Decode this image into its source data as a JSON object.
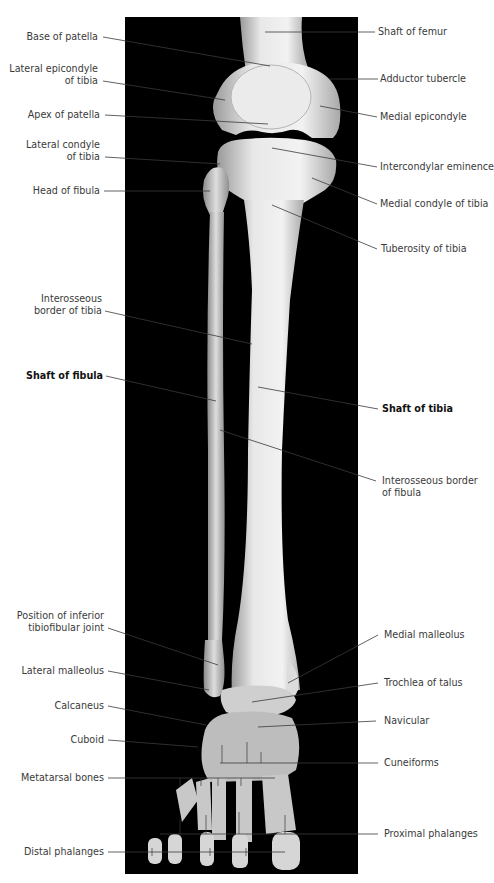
{
  "figure": {
    "panel_color": "#000000",
    "bone_color": "#e4e4e4",
    "leader_color": "#3a3a3a"
  },
  "labels_left": [
    {
      "id": "base-of-patella",
      "text": "Base of patella"
    },
    {
      "id": "lateral-epicondyle-of-tibia",
      "line1": "Lateral epicondyle",
      "line2": "of tibia"
    },
    {
      "id": "apex-of-patella",
      "text": "Apex of patella"
    },
    {
      "id": "lateral-condyle-of-tibia",
      "line1": "Lateral condyle",
      "line2": "of tibia"
    },
    {
      "id": "head-of-fibula",
      "text": "Head of fibula"
    },
    {
      "id": "interosseous-border-of-tibia",
      "line1": "Interosseous",
      "line2": "border of tibia"
    },
    {
      "id": "shaft-of-fibula",
      "text": "Shaft of fibula"
    },
    {
      "id": "position-of-inferior-tibiofibular-joint",
      "line1": "Position of inferior",
      "line2": "tibiofibular joint"
    },
    {
      "id": "lateral-malleolus",
      "text": "Lateral malleolus"
    },
    {
      "id": "calcaneus",
      "text": "Calcaneus"
    },
    {
      "id": "cuboid",
      "text": "Cuboid"
    },
    {
      "id": "metatarsal-bones",
      "text": "Metatarsal bones"
    },
    {
      "id": "distal-phalanges",
      "text": "Distal phalanges"
    }
  ],
  "labels_right": [
    {
      "id": "shaft-of-femur",
      "text": "Shaft of femur"
    },
    {
      "id": "adductor-tubercle",
      "text": "Adductor tubercle"
    },
    {
      "id": "medial-epicondyle",
      "text": "Medial epicondyle"
    },
    {
      "id": "intercondylar-eminence",
      "text": "Intercondylar eminence"
    },
    {
      "id": "medial-condyle-of-tibia",
      "text": "Medial condyle of tibia"
    },
    {
      "id": "tuberosity-of-tibia",
      "text": "Tuberosity of tibia"
    },
    {
      "id": "shaft-of-tibia",
      "text": "Shaft of tibia"
    },
    {
      "id": "interosseous-border-of-fibula",
      "line1": "Interosseous border",
      "line2": "of fibula"
    },
    {
      "id": "medial-malleolus",
      "text": "Medial malleolus"
    },
    {
      "id": "trochlea-of-talus",
      "text": "Trochlea of talus"
    },
    {
      "id": "navicular",
      "text": "Navicular"
    },
    {
      "id": "cuneiforms",
      "text": "Cuneiforms"
    },
    {
      "id": "proximal-phalanges",
      "text": "Proximal phalanges"
    }
  ]
}
